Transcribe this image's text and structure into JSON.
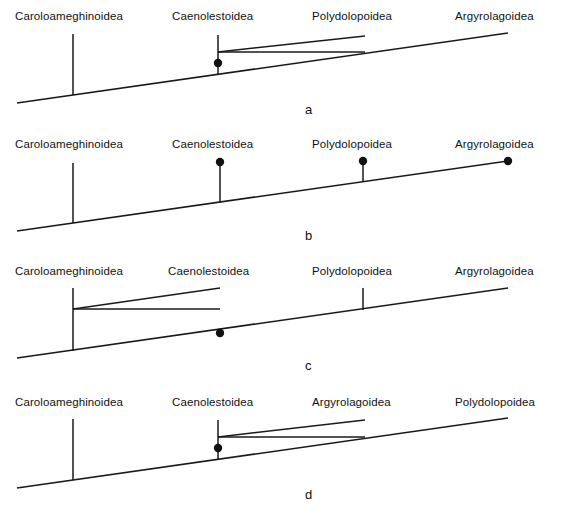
{
  "figure": {
    "width": 563,
    "height": 514,
    "background": "#ffffff",
    "line_color": "#1a1a1a",
    "text_color": "#111111"
  },
  "taxa": {
    "caroloameghinoidea": "Caroloameghinoidea",
    "caenolestoidea": "Caenolestoidea",
    "polydolopoidea": "Polydolopoidea",
    "argyrolagoidea": "Argyrolagoidea"
  },
  "panels": [
    {
      "id": "a",
      "letter": "a",
      "letter_x": 305,
      "letter_y": 102,
      "labels": [
        {
          "name": "label-caroloameghinoidea",
          "text": "Caroloameghinoidea",
          "x": 15,
          "y": 10
        },
        {
          "name": "label-caenolestoidea",
          "text": "Caenolestoidea",
          "x": 172,
          "y": 10
        },
        {
          "name": "label-polydolopoidea",
          "text": "Polydolopoidea",
          "x": 312,
          "y": 10
        },
        {
          "name": "label-argyrolagoidea",
          "text": "Argyrolagoidea",
          "x": 455,
          "y": 10
        }
      ],
      "baseline": {
        "x1": 17,
        "y1": 103,
        "x2": 508,
        "y2": 33
      },
      "stems": [
        {
          "name": "stem-caroloameghinoidea",
          "x1": 73,
          "y1": 34,
          "x2": 73,
          "y2": 95
        },
        {
          "name": "stem-caenolestoidea",
          "x1": 218,
          "y1": 35,
          "x2": 218,
          "y2": 74
        }
      ],
      "branches": [
        {
          "name": "branch-polydolopoidea",
          "x1": 218,
          "y1": 52,
          "x2": 365,
          "y2": 52
        },
        {
          "name": "branch-polydolopoidea-rise",
          "x1": 218,
          "y1": 52,
          "x2": 365,
          "y2": 36
        }
      ],
      "dots": [
        {
          "name": "node-caenolestoidea",
          "cx": 218,
          "cy": 63,
          "r": 4.2
        }
      ]
    },
    {
      "id": "b",
      "letter": "b",
      "letter_x": 305,
      "letter_y": 228,
      "labels": [
        {
          "name": "label-caroloameghinoidea",
          "text": "Caroloameghinoidea",
          "x": 15,
          "y": 138
        },
        {
          "name": "label-caenolestoidea",
          "text": "Caenolestoidea",
          "x": 172,
          "y": 138
        },
        {
          "name": "label-polydolopoidea",
          "text": "Polydolopoidea",
          "x": 312,
          "y": 138
        },
        {
          "name": "label-argyrolagoidea",
          "text": "Argyrolagoidea",
          "x": 455,
          "y": 138
        }
      ],
      "baseline": {
        "x1": 17,
        "y1": 231,
        "x2": 508,
        "y2": 161
      },
      "stems": [
        {
          "name": "stem-caroloameghinoidea",
          "x1": 73,
          "y1": 163,
          "x2": 73,
          "y2": 223
        },
        {
          "name": "stem-caenolestoidea",
          "x1": 220,
          "y1": 163,
          "x2": 220,
          "y2": 202
        },
        {
          "name": "stem-polydolopoidea",
          "x1": 363,
          "y1": 162,
          "x2": 363,
          "y2": 181
        }
      ],
      "branches": [],
      "dots": [
        {
          "name": "node-caenolestoidea",
          "cx": 220,
          "cy": 162,
          "r": 4.2
        },
        {
          "name": "node-polydolopoidea",
          "cx": 363,
          "cy": 161,
          "r": 4.2
        },
        {
          "name": "node-argyrolagoidea",
          "cx": 508,
          "cy": 161,
          "r": 4.2
        }
      ]
    },
    {
      "id": "c",
      "letter": "c",
      "letter_x": 305,
      "letter_y": 358,
      "labels": [
        {
          "name": "label-caroloameghinoidea",
          "text": "Caroloameghinoidea",
          "x": 15,
          "y": 265
        },
        {
          "name": "label-caenolestoidea",
          "text": "Caenolestoidea",
          "x": 168,
          "y": 265
        },
        {
          "name": "label-polydolopoidea",
          "text": "Polydolopoidea",
          "x": 312,
          "y": 265
        },
        {
          "name": "label-argyrolagoidea",
          "text": "Argyrolagoidea",
          "x": 455,
          "y": 265
        }
      ],
      "baseline": {
        "x1": 17,
        "y1": 358,
        "x2": 508,
        "y2": 288
      },
      "stems": [
        {
          "name": "stem-caroloameghinoidea",
          "x1": 73,
          "y1": 288,
          "x2": 73,
          "y2": 351
        },
        {
          "name": "stem-polydolopoidea",
          "x1": 363,
          "y1": 288,
          "x2": 363,
          "y2": 310
        }
      ],
      "branches": [
        {
          "name": "branch-caenolestoidea",
          "x1": 73,
          "y1": 309,
          "x2": 220,
          "y2": 309
        },
        {
          "name": "branch-caenolestoidea-rise",
          "x1": 73,
          "y1": 309,
          "x2": 220,
          "y2": 288
        }
      ],
      "dots": [
        {
          "name": "node-caenolestoidea",
          "cx": 220,
          "cy": 333,
          "r": 4.2
        }
      ]
    },
    {
      "id": "d",
      "letter": "d",
      "letter_x": 305,
      "letter_y": 487,
      "labels": [
        {
          "name": "label-caroloameghinoidea",
          "text": "Caroloameghinoidea",
          "x": 15,
          "y": 396
        },
        {
          "name": "label-caenolestoidea",
          "text": "Caenolestoidea",
          "x": 172,
          "y": 396
        },
        {
          "name": "label-argyrolagoidea",
          "text": "Argyrolagoidea",
          "x": 312,
          "y": 396
        },
        {
          "name": "label-polydolopoidea",
          "text": "Polydolopoidea",
          "x": 455,
          "y": 396
        }
      ],
      "baseline": {
        "x1": 17,
        "y1": 488,
        "x2": 508,
        "y2": 418
      },
      "stems": [
        {
          "name": "stem-caroloameghinoidea",
          "x1": 73,
          "y1": 419,
          "x2": 73,
          "y2": 480
        },
        {
          "name": "stem-caenolestoidea",
          "x1": 218,
          "y1": 420,
          "x2": 218,
          "y2": 459
        }
      ],
      "branches": [
        {
          "name": "branch-argyrolagoidea",
          "x1": 218,
          "y1": 437,
          "x2": 365,
          "y2": 437
        },
        {
          "name": "branch-argyrolagoidea-rise",
          "x1": 218,
          "y1": 437,
          "x2": 365,
          "y2": 420
        }
      ],
      "dots": [
        {
          "name": "node-caenolestoidea",
          "cx": 218,
          "cy": 448,
          "r": 4.2
        }
      ]
    }
  ]
}
